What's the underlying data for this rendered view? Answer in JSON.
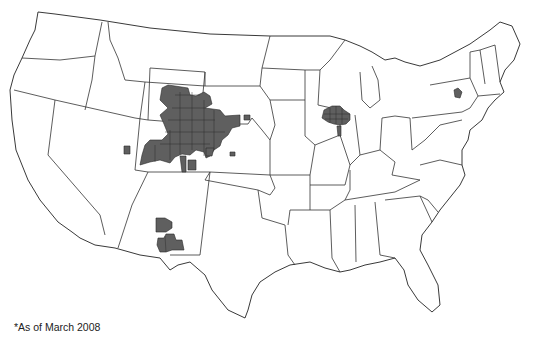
{
  "map": {
    "subject": "United States counties with shaded areas",
    "footnote": "*As of March 2008",
    "shaded_regions": [
      {
        "name": "Colorado / Wyoming / Nebraska cluster",
        "area": "northeastern Colorado, southeastern Wyoming, western Nebraska"
      },
      {
        "name": "Utah outliers",
        "area": "northeastern and central Utah"
      },
      {
        "name": "Kansas outlier",
        "area": "northwestern Kansas"
      },
      {
        "name": "New Mexico cluster",
        "area": "central and southern New Mexico"
      },
      {
        "name": "Wisconsin / Illinois cluster",
        "area": "south-central Wisconsin, northern Illinois"
      },
      {
        "name": "New York outlier",
        "area": "central New York"
      }
    ],
    "colors": {
      "shaded": "#5f5f5f",
      "outline": "#222222",
      "background": "#ffffff"
    }
  }
}
